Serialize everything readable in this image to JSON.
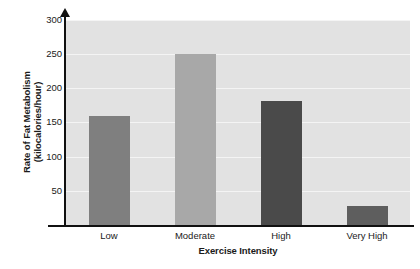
{
  "chart_data": {
    "type": "bar",
    "title": "",
    "subtitle": "",
    "categories": [
      "Low",
      "Moderate",
      "High",
      "Very High"
    ],
    "values": [
      160,
      250,
      182,
      28
    ],
    "series": [
      {
        "name": "Rate of Fat Metabolism",
        "values": [
          160,
          250,
          182,
          28
        ]
      }
    ],
    "bar_colors": [
      "#7f7f7f",
      "#a8a8a8",
      "#4a4a4a",
      "#5e5e5e"
    ],
    "xlabel": "Exercise Intensity",
    "ylabel_line1": "Rate of Fat Metabolism",
    "ylabel_line2": "(kilocalories/hour)",
    "ylabel": "Rate of Fat Metabolism (kilocalories/hour)",
    "ylim": [
      0,
      300
    ],
    "yticks": [
      50,
      100,
      150,
      200,
      250,
      300
    ],
    "ytick_labels": [
      "50",
      "100",
      "150",
      "200",
      "250",
      "300"
    ],
    "grid": true,
    "grid_axis": "y",
    "grid_color": "#f4f4f4",
    "legend": false,
    "legend_position": "none",
    "plot_background": "#e2e2e2",
    "axis_color": "#111111",
    "y_axis_arrow": true
  },
  "axes": {
    "y_title_line1": "Rate of Fat Metabolism",
    "y_title_line2": "(kilocalories/hour)",
    "x_title": "Exercise Intensity"
  },
  "ticks": {
    "y": [
      "300",
      "250",
      "200",
      "150",
      "100",
      "50"
    ],
    "x": [
      "Low",
      "Moderate",
      "High",
      "Very High"
    ]
  }
}
